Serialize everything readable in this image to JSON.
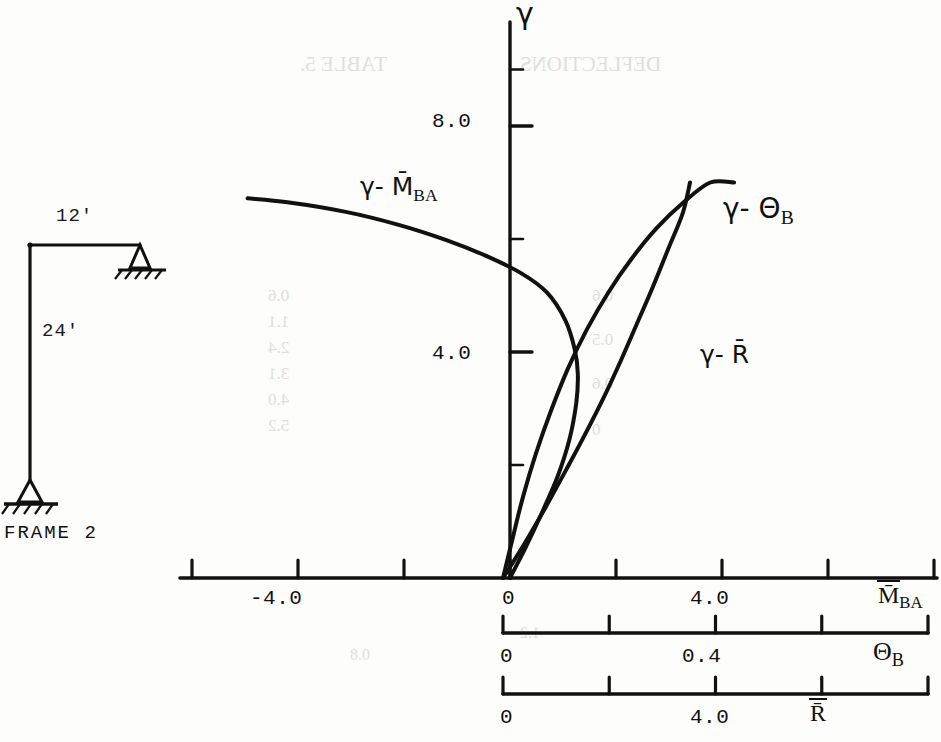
{
  "figure": {
    "caption": "FRAME 2",
    "frame_dims": {
      "top_span": "12'",
      "column_height": "24'"
    }
  },
  "chart_data": {
    "type": "line",
    "title": "",
    "ylabel": "γ",
    "ylim": [
      0,
      9.2
    ],
    "yticks": [
      2.0,
      4.0,
      6.0,
      8.0
    ],
    "ytick_labels": [
      "",
      "4.0",
      "",
      "8.0"
    ],
    "grid": false,
    "legend": "inline-annotations",
    "axes": [
      {
        "name": "M_BA",
        "label": "M̄",
        "label_sub": "BA",
        "xlim": [
          -6.0,
          8.0
        ],
        "xticks": [
          -6.0,
          -4.0,
          -2.0,
          0,
          2.0,
          4.0,
          6.0,
          8.0
        ],
        "xtick_labels": [
          "",
          "-4.0",
          "",
          "0",
          "",
          "4.0",
          "",
          ""
        ]
      },
      {
        "name": "theta_B",
        "label": "Θ",
        "label_sub": "B",
        "xlim": [
          0,
          0.8
        ],
        "xticks": [
          0,
          0.2,
          0.4,
          0.6,
          0.8
        ],
        "xtick_labels": [
          "0",
          "",
          "0.4",
          "",
          ""
        ]
      },
      {
        "name": "R",
        "label": "R̄",
        "label_sub": "",
        "xlim": [
          0,
          8.0
        ],
        "xticks": [
          0,
          2.0,
          4.0,
          6.0,
          8.0
        ],
        "xtick_labels": [
          "0",
          "",
          "4.0",
          "",
          ""
        ]
      }
    ],
    "series": [
      {
        "name": "gamma-M_BA",
        "label": "γ- M̄",
        "label_sub": "BA",
        "axis": "M_BA",
        "points": [
          [
            0.0,
            0.0
          ],
          [
            0.3,
            0.55
          ],
          [
            0.6,
            1.15
          ],
          [
            0.9,
            1.8
          ],
          [
            1.12,
            2.45
          ],
          [
            1.25,
            3.1
          ],
          [
            1.28,
            3.62
          ],
          [
            1.22,
            4.05
          ],
          [
            1.05,
            4.55
          ],
          [
            0.7,
            5.05
          ],
          [
            0.2,
            5.4
          ],
          [
            -0.45,
            5.7
          ],
          [
            -1.2,
            5.98
          ],
          [
            -2.1,
            6.25
          ],
          [
            -3.1,
            6.48
          ],
          [
            -4.2,
            6.65
          ],
          [
            -4.95,
            6.72
          ]
        ]
      },
      {
        "name": "gamma-theta_B",
        "label": "γ- Θ",
        "label_sub": "B",
        "axis": "theta_B",
        "points": [
          [
            0.0,
            0.0
          ],
          [
            0.04,
            0.6
          ],
          [
            0.08,
            1.25
          ],
          [
            0.118,
            1.9
          ],
          [
            0.155,
            2.55
          ],
          [
            0.19,
            3.2
          ],
          [
            0.222,
            3.85
          ],
          [
            0.252,
            4.5
          ],
          [
            0.282,
            5.15
          ],
          [
            0.31,
            5.8
          ],
          [
            0.338,
            6.45
          ],
          [
            0.352,
            7.0
          ]
        ]
      },
      {
        "name": "gamma-R",
        "label": "γ- R̄",
        "label_sub": "",
        "axis": "R",
        "points": [
          [
            0.0,
            0.0
          ],
          [
            0.18,
            0.7
          ],
          [
            0.38,
            1.45
          ],
          [
            0.62,
            2.2
          ],
          [
            0.9,
            2.95
          ],
          [
            1.22,
            3.7
          ],
          [
            1.58,
            4.4
          ],
          [
            1.98,
            5.05
          ],
          [
            2.42,
            5.65
          ],
          [
            2.9,
            6.2
          ],
          [
            3.4,
            6.65
          ],
          [
            3.9,
            7.0
          ],
          [
            4.35,
            7.0
          ]
        ],
        "note": "plotted right-to-left: reaches axis near 4.3"
      }
    ],
    "annotations": [
      {
        "text": "γ- M̄",
        "sub": "BA",
        "x": 360,
        "y": 185
      },
      {
        "text": "γ- Θ",
        "sub": "B",
        "x": 723,
        "y": 203
      },
      {
        "text": "γ- R̄",
        "sub": "",
        "x": 700,
        "y": 350
      }
    ]
  },
  "ghost_text": [
    {
      "t": "TABLE 5.",
      "x": 300,
      "y": 52,
      "size": 21
    },
    {
      "t": "DEFLECTIONS",
      "x": 520,
      "y": 52,
      "size": 21
    },
    {
      "t": "0.6",
      "x": 268,
      "y": 286,
      "size": 17
    },
    {
      "t": "1.1",
      "x": 268,
      "y": 312,
      "size": 17
    },
    {
      "t": "2.4",
      "x": 268,
      "y": 338,
      "size": 17
    },
    {
      "t": "3.1",
      "x": 268,
      "y": 364,
      "size": 17
    },
    {
      "t": "4.0",
      "x": 268,
      "y": 390,
      "size": 17
    },
    {
      "t": "5.2",
      "x": 268,
      "y": 416,
      "size": 17
    },
    {
      "t": "0.6",
      "x": 592,
      "y": 286,
      "size": 17
    },
    {
      "t": "0.5",
      "x": 592,
      "y": 330,
      "size": 17
    },
    {
      "t": "0.6",
      "x": 592,
      "y": 374,
      "size": 17
    },
    {
      "t": "0",
      "x": 592,
      "y": 420,
      "size": 17
    },
    {
      "t": "1.2",
      "x": 520,
      "y": 624,
      "size": 16
    },
    {
      "t": "0.8",
      "x": 350,
      "y": 646,
      "size": 16
    }
  ]
}
